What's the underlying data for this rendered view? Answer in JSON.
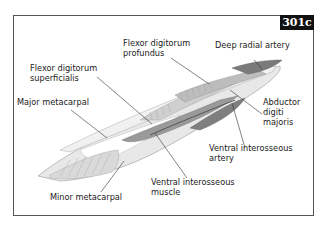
{
  "figure": {
    "id_badge": "301c"
  },
  "labels": {
    "flexor_digitorum_profundus": [
      "Flexor digitorum",
      "profundus"
    ],
    "deep_radial_artery": "Deep radial artery",
    "flexor_digitorum_superficialis": [
      "Flexor digitorum",
      "superficialis"
    ],
    "major_metacarpal": "Major metacarpal",
    "abductor_digiti_majoris": [
      "Abductor",
      "digiti",
      "majoris"
    ],
    "ventral_interosseous_artery": [
      "Ventral interosseous",
      "artery"
    ],
    "ventral_interosseous_muscle": [
      "Ventral interosseous",
      "muscle"
    ],
    "minor_metacarpal": "Minor metacarpal"
  },
  "colors": {
    "badge_bg": "#111111",
    "bone": "#e4e4e4",
    "muscle_light": "#cfcfcf",
    "muscle_dark": "#8a8a8a",
    "artery": "#6a6a6a",
    "leader": "#333333"
  }
}
